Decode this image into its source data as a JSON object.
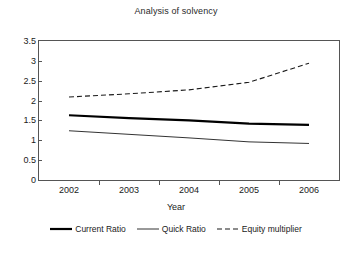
{
  "chart_data": {
    "type": "line",
    "title": "Analysis of solvency",
    "xlabel": "Year",
    "ylabel": "",
    "categories": [
      "2002",
      "2003",
      "2004",
      "2005",
      "2006"
    ],
    "ylim": [
      0,
      3.5
    ],
    "yticks": [
      0,
      0.5,
      1,
      1.5,
      2,
      2.5,
      3,
      3.5
    ],
    "ytick_labels": [
      "0",
      "0.5",
      "1",
      "1.5",
      "2",
      "2.5",
      "3",
      "3.5"
    ],
    "grid": false,
    "legend_position": "bottom",
    "series": [
      {
        "name": "Current Ratio",
        "style": "solid-thick",
        "color": "#000000",
        "values": [
          1.63,
          1.56,
          1.5,
          1.42,
          1.39
        ]
      },
      {
        "name": "Quick Ratio",
        "style": "solid-thin",
        "color": "#333333",
        "values": [
          1.24,
          1.15,
          1.06,
          0.96,
          0.92
        ]
      },
      {
        "name": "Equity multiplier",
        "style": "dashed",
        "color": "#1a1a1a",
        "values": [
          2.09,
          2.17,
          2.27,
          2.46,
          2.94
        ]
      }
    ]
  },
  "axis": {
    "x_title": "Year"
  }
}
